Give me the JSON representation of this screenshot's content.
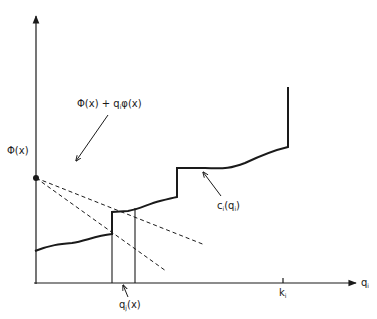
{
  "figure": {
    "type": "economics cost diagram",
    "axes": {
      "x_label": "q",
      "x_label_sub": "i",
      "tick_label": "k",
      "tick_label_sub": "i"
    },
    "labels": {
      "phi_x": "Φ(x)",
      "line_label_a": "Φ(x) + q",
      "line_label_sub": "i",
      "line_label_b": "φ(x)",
      "curve_label_a": "c",
      "curve_label_sub": "i",
      "curve_label_b": "(q",
      "curve_label_sub2": "i",
      "curve_label_c": ")",
      "qj_label_a": "q",
      "qj_label_sub": "j",
      "qj_label_b": "(x)"
    },
    "colors": {
      "ink": "#1a1a1a",
      "background": "#ffffff"
    }
  }
}
